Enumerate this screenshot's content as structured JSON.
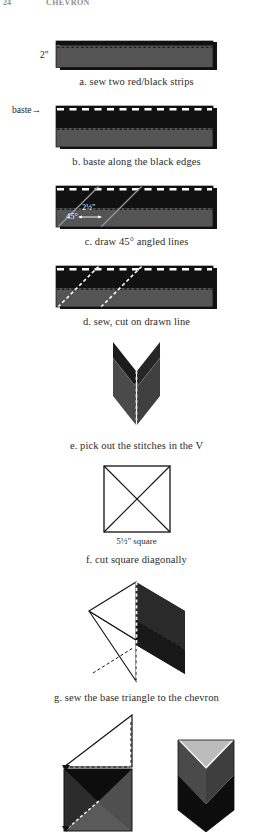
{
  "page": {
    "folio": "24",
    "running_title": "CHEVRON",
    "background": "#ffffff"
  },
  "palette": {
    "black": "#111111",
    "dark_gray": "#3a3a3a",
    "mid_gray": "#4e4e4e",
    "red_gray": "#545454",
    "light_gray": "#b9b9b9",
    "white": "#ffffff",
    "stitch_white": "#ffffff",
    "outline": "#111111"
  },
  "steps": [
    {
      "id": "a",
      "caption": "a. sew two red/black strips",
      "side_label": "2\"",
      "figure": "two-strips-sewn"
    },
    {
      "id": "b",
      "caption": "b. baste along the black edges",
      "side_label": "baste",
      "arrow": "→",
      "figure": "basted-strip"
    },
    {
      "id": "c",
      "caption": "c. draw 45° angled lines",
      "angle_label": "45°",
      "measure_label": "2½\"",
      "figure": "strip-with-45-lines"
    },
    {
      "id": "d",
      "caption": "d. sew, cut on drawn line",
      "figure": "strip-sewn-on-lines"
    },
    {
      "id": "e",
      "caption": "e. pick out the stitches in the V",
      "figure": "chevron-v"
    },
    {
      "id": "f",
      "caption": "f. cut square diagonally",
      "sub_label": "5½\" square",
      "figure": "square-with-diagonals"
    },
    {
      "id": "g",
      "caption": "g. sew the base triangle to the chevron",
      "figure": "chevron-plus-triangle"
    },
    {
      "id": "h",
      "caption": "",
      "figure": "block-assembly-and-finished-block"
    }
  ]
}
